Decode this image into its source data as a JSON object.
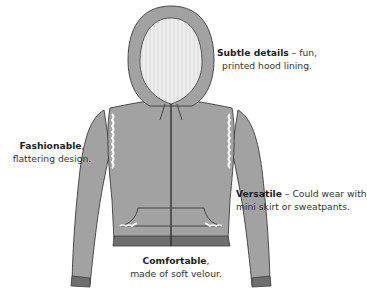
{
  "figure": {
    "colors": {
      "body": "#a2a2a2",
      "outline": "#3c3c3c",
      "hood_lining": "#ececec",
      "cuff_band": "#6e6e6e",
      "lace_trim": "#ffffff",
      "background": "#ffffff"
    }
  },
  "callouts": [
    {
      "title": "Subtle details",
      "separator": " – ",
      "text_line1": "fun,",
      "text_line2": "printed hood lining."
    },
    {
      "title": "Fashionable",
      "separator": ",",
      "text_line1": "",
      "text_line2": "flattering design."
    },
    {
      "title": "Versatile",
      "separator": " – ",
      "text_line1": "Could wear with",
      "text_line2": "mini skirt or sweatpants."
    },
    {
      "title": "Comfortable",
      "separator": ",",
      "text_line1": "",
      "text_line2": "made of soft velour."
    }
  ]
}
